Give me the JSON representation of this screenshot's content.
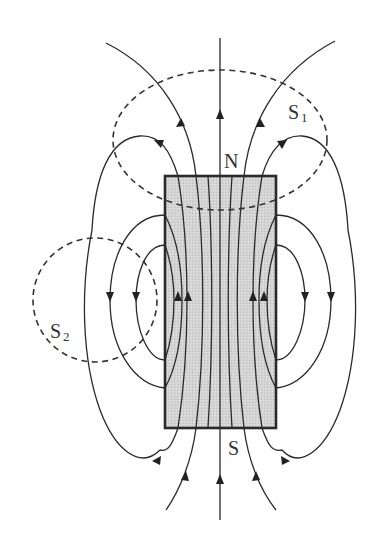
{
  "diagram": {
    "magnet": {
      "north_label": "N",
      "south_label": "S",
      "fill_color": "#d2d2d2",
      "border_color": "#2a2a2a"
    },
    "surfaces": [
      {
        "id": "S1",
        "label": "S",
        "subscript": "1",
        "style": "dashed",
        "shape": "ellipse"
      },
      {
        "id": "S2",
        "label": "S",
        "subscript": "2",
        "style": "dashed",
        "shape": "circle"
      }
    ],
    "line_color": "#2a2a2a"
  }
}
